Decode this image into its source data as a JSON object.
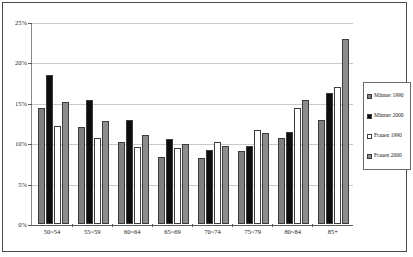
{
  "chart_data": {
    "type": "bar",
    "title": "",
    "xlabel": "",
    "ylabel": "",
    "ylim": [
      0,
      25
    ],
    "ytick_labels": [
      "0%",
      "5%",
      "10%",
      "15%",
      "20%",
      "25%"
    ],
    "ytick_values": [
      0,
      5,
      10,
      15,
      20,
      25
    ],
    "grid": true,
    "legend_position": "right",
    "categories": [
      "50~54",
      "55~59",
      "60~64",
      "65~69",
      "70~74",
      "75~79",
      "80~84",
      "85+"
    ],
    "series": [
      {
        "name": "Männer 1990",
        "color": "#808080",
        "values": [
          14.3,
          12.0,
          10.1,
          8.3,
          8.2,
          9.0,
          10.6,
          12.9
        ]
      },
      {
        "name": "Männer 2000",
        "color": "#0d0d0d",
        "values": [
          18.4,
          15.3,
          12.9,
          10.5,
          9.2,
          9.6,
          11.4,
          16.2
        ]
      },
      {
        "name": "Frauen 1990",
        "color": "#ffffff",
        "values": [
          12.1,
          10.6,
          9.5,
          9.4,
          10.2,
          11.6,
          14.4,
          17.0
        ]
      },
      {
        "name": "Frauen 2000",
        "color": "#8c8c8c",
        "values": [
          15.1,
          12.8,
          11.0,
          9.9,
          9.6,
          11.3,
          15.4,
          22.9
        ]
      }
    ]
  }
}
